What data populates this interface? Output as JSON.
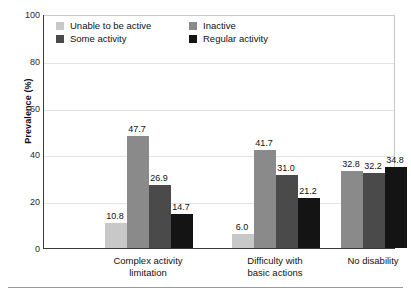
{
  "chart_data": {
    "type": "bar",
    "title": "",
    "xlabel": "",
    "ylabel": "Prevalence (%)",
    "ylim": [
      0,
      100
    ],
    "yticks": [
      0,
      20,
      40,
      60,
      80,
      100
    ],
    "grid": true,
    "legend_position": "top-left-inside",
    "categories": [
      "Complex activity limitation",
      "Difficulty with basic actions",
      "No disability"
    ],
    "series": [
      {
        "name": "Unable to be active",
        "color": "#c8c8c8",
        "values": [
          10.8,
          6.0,
          null
        ],
        "labels": [
          "10.8",
          "6.0",
          ""
        ]
      },
      {
        "name": "Inactive",
        "color": "#8a8a8a",
        "values": [
          47.7,
          41.7,
          32.8
        ],
        "labels": [
          "47.7",
          "41.7",
          "32.8"
        ]
      },
      {
        "name": "Some activity",
        "color": "#4a4a4a",
        "values": [
          26.9,
          31.0,
          32.2
        ],
        "labels": [
          "26.9",
          "31.0",
          "32.2"
        ]
      },
      {
        "name": "Regular activity",
        "color": "#141414",
        "values": [
          14.7,
          21.2,
          34.8
        ],
        "labels": [
          "14.7",
          "21.2",
          "34.8"
        ]
      }
    ]
  },
  "axes": {
    "y_title": "Prevalence (%)",
    "y_ticks": [
      "100",
      "80",
      "60",
      "40",
      "20",
      "0"
    ],
    "x_group_labels": [
      {
        "line1": "Complex activity",
        "line2": "limitation"
      },
      {
        "line1": "Difficulty with",
        "line2": "basic actions"
      },
      {
        "line1": "No disability",
        "line2": ""
      }
    ]
  },
  "legend": {
    "items": [
      {
        "label": "Unable to be active",
        "color": "#c8c8c8"
      },
      {
        "label": "Inactive",
        "color": "#8a8a8a"
      },
      {
        "label": "Some activity",
        "color": "#4a4a4a"
      },
      {
        "label": "Regular activity",
        "color": "#141414"
      }
    ]
  }
}
